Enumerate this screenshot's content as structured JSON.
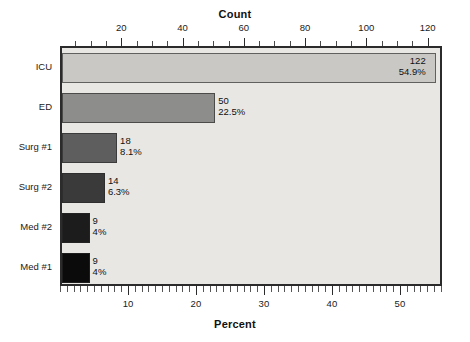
{
  "chart_data": {
    "type": "bar",
    "orientation": "horizontal",
    "title": "",
    "top_axis": {
      "label": "Count",
      "ticks": [
        20,
        40,
        60,
        80,
        100,
        120
      ],
      "tick_labels": [
        "20",
        "40",
        "60",
        "80",
        "100",
        "120"
      ],
      "minor_interval": 5,
      "range": [
        0,
        124.7
      ]
    },
    "bottom_axis": {
      "label": "Percent",
      "ticks": [
        10,
        20,
        30,
        40,
        50
      ],
      "tick_labels": [
        "10",
        "20",
        "30",
        "40",
        "50"
      ],
      "minor_interval": 1,
      "range": [
        0,
        56.2
      ]
    },
    "categories": [
      "ICU",
      "ED",
      "Surg #1",
      "Surg #2",
      "Med #2",
      "Med #1"
    ],
    "values": [
      122,
      50,
      18,
      14,
      9,
      9
    ],
    "percent_labels": [
      "54.9%",
      "22.5%",
      "8.1%",
      "6.3%",
      "4%",
      "4%"
    ],
    "count_labels": [
      "122",
      "50",
      "18",
      "14",
      "9",
      "9"
    ],
    "colors": [
      "#c9c8c5",
      "#8d8d8b",
      "#5e5e5e",
      "#3a3a3a",
      "#1c1c1c",
      "#0b0b0b"
    ],
    "grid": false,
    "legend": null,
    "total": 222,
    "bars": [
      {
        "category": "ICU",
        "count": 122,
        "percent": "54.9%",
        "color": "#c9c8c5",
        "label_inside": true
      },
      {
        "category": "ED",
        "count": 50,
        "percent": "22.5%",
        "color": "#8d8d8b",
        "label_inside": false
      },
      {
        "category": "Surg #1",
        "count": 18,
        "percent": "8.1%",
        "color": "#5e5e5e",
        "label_inside": false
      },
      {
        "category": "Surg #2",
        "count": 14,
        "percent": "6.3%",
        "color": "#3a3a3a",
        "label_inside": false
      },
      {
        "category": "Med #2",
        "count": 9,
        "percent": "4%",
        "color": "#1c1c1c",
        "label_inside": false
      },
      {
        "category": "Med #1",
        "count": 9,
        "percent": "4%",
        "color": "#0b0b0b",
        "label_inside": false
      }
    ]
  },
  "plot": {
    "background": "#e8e7e4",
    "border_color": "#2b2b2b"
  }
}
